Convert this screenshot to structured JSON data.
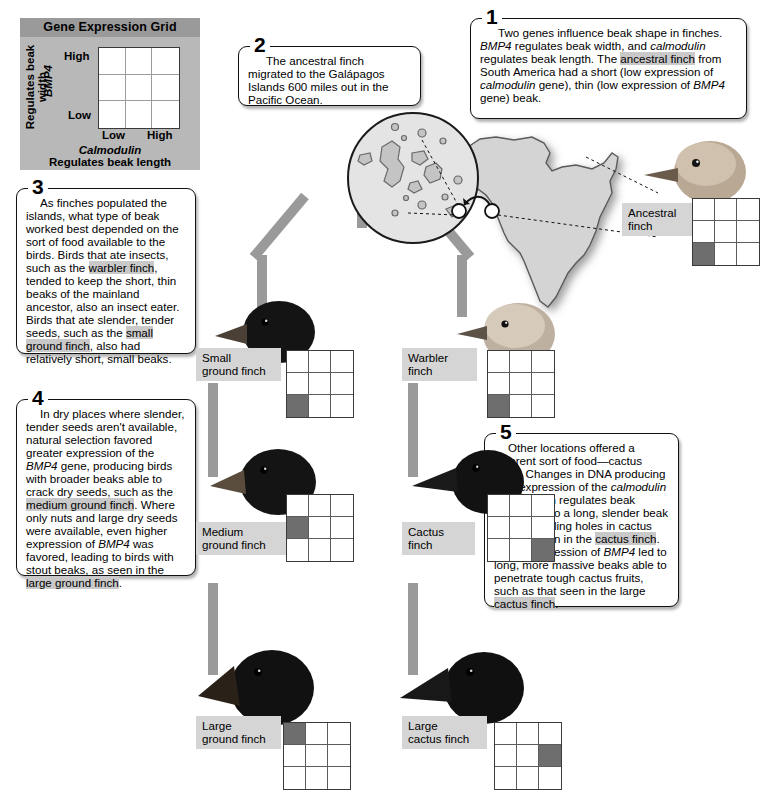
{
  "legend": {
    "title": "Gene Expression Grid",
    "y_high": "High",
    "y_low": "Low",
    "x_low": "Low",
    "x_high": "High",
    "y_axis_gene": "BMP4",
    "y_axis_desc": "Regulates beak width",
    "x_axis_gene": "Calmodulin",
    "x_axis_desc": "Regulates beak length",
    "panel_color": "#b8b8b8",
    "title_color": "#9a9a9a",
    "fill_color": "#6e6e6e"
  },
  "callouts": [
    {
      "number": "1",
      "text": "Two genes influence beak shape in finches. BMP4 regulates beak width, and calmodulin regulates beak length. The ancestral finch from South America had a short (low expression of calmodulin gene), thin (low expression of BMP4 gene) beak.",
      "italics": [
        "BMP4",
        "calmodulin",
        "calmodulin",
        "BMP4"
      ],
      "highlights": [
        "ancestral finch"
      ]
    },
    {
      "number": "2",
      "text": "The ancestral finch migrated to the Galápagos Islands 600 miles out in the Pacific Ocean.",
      "italics": [],
      "highlights": []
    },
    {
      "number": "3",
      "text": "As finches populated the islands, what type of beak worked best depended on the sort of food available to the birds. Birds that ate insects, such as the warbler finch, tended to keep the short, thin beaks of the mainland ancestor, also an insect eater. Birds that ate slender, tender seeds, such as the small ground finch, also had relatively short, small beaks.",
      "italics": [],
      "highlights": [
        "warbler finch",
        "small ground finch"
      ]
    },
    {
      "number": "4",
      "text": "In dry places where slender, tender seeds aren't available, natural selection favored greater expression of the BMP4 gene, producing birds with broader beaks able to crack dry seeds, such as the medium ground finch. Where only nuts and large dry seeds were available, even higher expression of BMP4 was favored, leading to birds with stout beaks, as seen in the large ground finch.",
      "italics": [
        "BMP4",
        "BMP4"
      ],
      "highlights": [
        "medium ground finch",
        "large ground finch"
      ]
    },
    {
      "number": "5",
      "text": "Other locations offered a different sort of food—cactus fruits. Changes in DNA producing high expression of the calmodulin gene, which regulates beak length, led to a long, slender beak ideal for drilling holes in cactus fruit, as seen in the cactus finch. Higher expression of BMP4 led to long, more massive beaks able to penetrate tough cactus fruits, such as that seen in the large cactus finch.",
      "italics": [
        "calmodulin",
        "BMP4"
      ],
      "highlights": [
        "cactus finch",
        "large cactus finch"
      ]
    }
  ],
  "finches": [
    {
      "id": "ancestral",
      "label": "Ancestral\nfinch",
      "grid": [
        [
          0,
          0,
          0
        ],
        [
          0,
          0,
          0
        ],
        [
          1,
          0,
          0
        ]
      ]
    },
    {
      "id": "small-ground",
      "label": "Small\nground finch",
      "grid": [
        [
          0,
          0,
          0
        ],
        [
          0,
          0,
          0
        ],
        [
          1,
          0,
          0
        ]
      ]
    },
    {
      "id": "warbler",
      "label": "Warbler\nfinch",
      "grid": [
        [
          0,
          0,
          0
        ],
        [
          0,
          0,
          0
        ],
        [
          1,
          0,
          0
        ]
      ]
    },
    {
      "id": "medium-ground",
      "label": "Medium\nground finch",
      "grid": [
        [
          0,
          0,
          0
        ],
        [
          1,
          0,
          0
        ],
        [
          0,
          0,
          0
        ]
      ]
    },
    {
      "id": "cactus",
      "label": "Cactus\nfinch",
      "grid": [
        [
          0,
          0,
          0
        ],
        [
          0,
          0,
          0
        ],
        [
          0,
          0,
          1
        ]
      ]
    },
    {
      "id": "large-ground",
      "label": "Large\nground finch",
      "grid": [
        [
          1,
          0,
          0
        ],
        [
          0,
          0,
          0
        ],
        [
          0,
          0,
          0
        ]
      ]
    },
    {
      "id": "large-cactus",
      "label": "Large\ncactus finch",
      "grid": [
        [
          0,
          0,
          0
        ],
        [
          0,
          0,
          1
        ],
        [
          0,
          0,
          0
        ]
      ]
    }
  ],
  "map": {
    "inset_name": "galapagos-islands-inset",
    "landmass_name": "south-america",
    "connector_color": "#9a9a9a"
  }
}
